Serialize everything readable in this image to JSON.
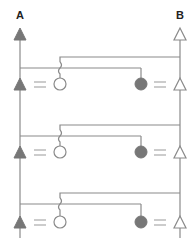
{
  "diagram": {
    "title": "",
    "labels": {
      "left": "A",
      "right": "B"
    },
    "colors": {
      "line": "#8a8a8a",
      "filled": "#777777",
      "hollow_fill": "#ffffff",
      "background": "#ffffff"
    },
    "rails": {
      "left": {
        "label": "A",
        "x": 20,
        "top_symbol": "filled-triangle"
      },
      "right": {
        "label": "B",
        "x": 180,
        "top_symbol": "hollow-triangle"
      }
    },
    "rows": [
      {
        "index": 1,
        "upper_wire_y": 57,
        "lower_wire_y": 68,
        "symbol_y": 84,
        "left": [
          "filled-triangle",
          "equals",
          "hollow-circle"
        ],
        "right": [
          "filled-circle",
          "equals",
          "hollow-triangle"
        ]
      },
      {
        "index": 2,
        "upper_wire_y": 125,
        "lower_wire_y": 136,
        "symbol_y": 152,
        "left": [
          "filled-triangle",
          "equals",
          "hollow-circle"
        ],
        "right": [
          "filled-circle",
          "equals",
          "hollow-triangle"
        ]
      },
      {
        "index": 3,
        "upper_wire_y": 193,
        "lower_wire_y": 204,
        "symbol_y": 222,
        "left": [
          "filled-triangle",
          "equals",
          "hollow-circle"
        ],
        "right": [
          "filled-circle",
          "equals",
          "hollow-triangle"
        ]
      }
    ],
    "connections": [
      "right rail B connects via upper wire to hollow circle (wire hops over lower wire)",
      "left rail A connects via lower wire to filled circle"
    ]
  }
}
